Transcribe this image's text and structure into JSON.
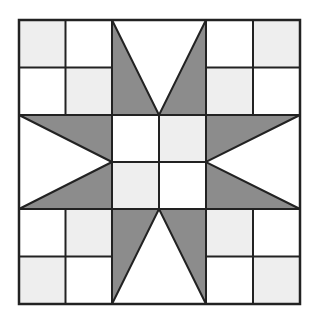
{
  "diagram": {
    "type": "quilt-block",
    "grid": {
      "x": [
        19,
        65.5,
        112,
        159,
        206,
        253,
        300
      ],
      "y": [
        20,
        67.5,
        115,
        162,
        209,
        256.5,
        304
      ]
    },
    "colors": {
      "background": "#ffffff",
      "light": "#eeeeee",
      "dark": "#8c8c8c",
      "line": "#222222"
    },
    "light_squares": [
      {
        "col": 0,
        "row": 0
      },
      {
        "col": 1,
        "row": 1
      },
      {
        "col": 5,
        "row": 0
      },
      {
        "col": 4,
        "row": 1
      },
      {
        "col": 0,
        "row": 5
      },
      {
        "col": 1,
        "row": 4
      },
      {
        "col": 5,
        "row": 5
      },
      {
        "col": 4,
        "row": 4
      },
      {
        "col": 3,
        "row": 2
      },
      {
        "col": 2,
        "row": 3
      }
    ],
    "star_points": [
      {
        "name": "top-left-point",
        "points": [
          [
            112,
            20
          ],
          [
            112,
            115
          ],
          [
            159,
            115
          ]
        ]
      },
      {
        "name": "top-right-point",
        "points": [
          [
            206,
            20
          ],
          [
            206,
            115
          ],
          [
            159,
            115
          ]
        ]
      },
      {
        "name": "left-upper-point",
        "points": [
          [
            19,
            115
          ],
          [
            112,
            115
          ],
          [
            112,
            162
          ]
        ]
      },
      {
        "name": "left-lower-point",
        "points": [
          [
            19,
            209
          ],
          [
            112,
            209
          ],
          [
            112,
            162
          ]
        ]
      },
      {
        "name": "right-upper-point",
        "points": [
          [
            300,
            115
          ],
          [
            206,
            115
          ],
          [
            206,
            162
          ]
        ]
      },
      {
        "name": "right-lower-point",
        "points": [
          [
            300,
            209
          ],
          [
            206,
            209
          ],
          [
            206,
            162
          ]
        ]
      },
      {
        "name": "bottom-left-point",
        "points": [
          [
            112,
            304
          ],
          [
            112,
            209
          ],
          [
            159,
            209
          ]
        ]
      },
      {
        "name": "bottom-right-point",
        "points": [
          [
            206,
            304
          ],
          [
            206,
            209
          ],
          [
            159,
            209
          ]
        ]
      }
    ],
    "grid_lines": [
      {
        "name": "corner-tl-v",
        "x1": 65.5,
        "y1": 20,
        "x2": 65.5,
        "y2": 115
      },
      {
        "name": "corner-tl-h",
        "x1": 19,
        "y1": 67.5,
        "x2": 112,
        "y2": 67.5
      },
      {
        "name": "corner-tr-v",
        "x1": 253,
        "y1": 20,
        "x2": 253,
        "y2": 115
      },
      {
        "name": "corner-tr-h",
        "x1": 206,
        "y1": 67.5,
        "x2": 300,
        "y2": 67.5
      },
      {
        "name": "corner-bl-v",
        "x1": 65.5,
        "y1": 209,
        "x2": 65.5,
        "y2": 304
      },
      {
        "name": "corner-bl-h",
        "x1": 19,
        "y1": 256.5,
        "x2": 112,
        "y2": 256.5
      },
      {
        "name": "corner-br-v",
        "x1": 253,
        "y1": 209,
        "x2": 253,
        "y2": 304
      },
      {
        "name": "corner-br-h",
        "x1": 206,
        "y1": 256.5,
        "x2": 300,
        "y2": 256.5
      },
      {
        "name": "col-line-1",
        "x1": 112,
        "y1": 20,
        "x2": 112,
        "y2": 304
      },
      {
        "name": "col-line-2",
        "x1": 206,
        "y1": 20,
        "x2": 206,
        "y2": 304
      },
      {
        "name": "row-line-1",
        "x1": 19,
        "y1": 115,
        "x2": 300,
        "y2": 115
      },
      {
        "name": "row-line-2",
        "x1": 19,
        "y1": 209,
        "x2": 300,
        "y2": 209
      },
      {
        "name": "center-v",
        "x1": 159,
        "y1": 115,
        "x2": 159,
        "y2": 209
      },
      {
        "name": "center-h",
        "x1": 112,
        "y1": 162,
        "x2": 206,
        "y2": 162
      }
    ]
  }
}
